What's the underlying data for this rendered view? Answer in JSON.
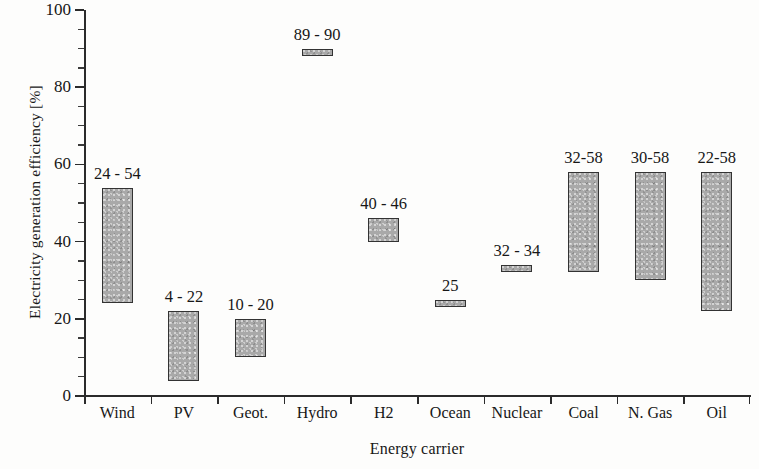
{
  "chart_data": {
    "type": "bar",
    "title": "",
    "xlabel": "Energy carrier",
    "ylabel": "Electricity generation efficiency  [%]",
    "ylim": [
      0,
      100
    ],
    "ytick_labels": [
      "0",
      "20",
      "40",
      "60",
      "80",
      "100"
    ],
    "ytick_values": [
      0,
      20,
      40,
      60,
      80,
      100
    ],
    "yminor_step": 5,
    "grid": false,
    "legend": null,
    "categories": [
      "Wind",
      "PV",
      "Geot.",
      "Hydro",
      "H2",
      "Ocean",
      "Nuclear",
      "Coal",
      "N. Gas",
      "Oil"
    ],
    "series": [
      {
        "name": "Electricity generation efficiency range",
        "low": [
          24,
          4,
          10,
          89,
          40,
          25,
          32,
          32,
          30,
          22
        ],
        "high": [
          54,
          22,
          20,
          90,
          46,
          25,
          34,
          58,
          58,
          58
        ]
      }
    ],
    "annotations": [
      "24 - 54",
      "4 - 22",
      "10 - 20",
      "89 - 90",
      "40 - 46",
      "25",
      "32 - 34",
      "32-58",
      "30-58",
      "22-58"
    ],
    "colors": {
      "bar_fill": "#a9a9a9",
      "bar_edge": "#333333",
      "axis": "#2b2b2b",
      "text": "#171717",
      "background": "#fdfdfc"
    }
  }
}
